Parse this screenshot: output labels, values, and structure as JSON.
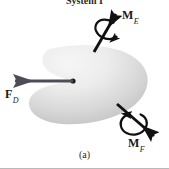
{
  "figure": {
    "title": "System I",
    "caption": "(a)",
    "background_color": "#ffffff",
    "body": {
      "name": "rigid-body-blob",
      "fill_light": "#f2f2f2",
      "fill_dark": "#c2c2c2",
      "shape": "kidney-shaped closed region with concave notch on the left side"
    },
    "center_point": {
      "label": "",
      "x": 73,
      "y": 81,
      "color": "#1c1c1c"
    },
    "vectors": [
      {
        "id": "FD",
        "symbol": "F",
        "subscript": "D",
        "label": "F_D",
        "kind": "force",
        "color": "#4d4d57",
        "direction": "left",
        "description": "force arrow pointing left from the center point"
      },
      {
        "id": "ME",
        "symbol": "M",
        "subscript": "E",
        "label": "M_E",
        "kind": "moment",
        "color": "#111111",
        "direction": "up-right",
        "sense": "counterclockwise about the arrow axis",
        "description": "double-headed style moment vector with curved rotation arrow around shaft"
      },
      {
        "id": "MF",
        "symbol": "M",
        "subscript": "F",
        "label": "M_F",
        "kind": "moment",
        "color": "#111111",
        "direction": "down-right",
        "sense": "counterclockwise about the arrow axis",
        "description": "moment vector with curved rotation arrow around shaft"
      }
    ]
  }
}
